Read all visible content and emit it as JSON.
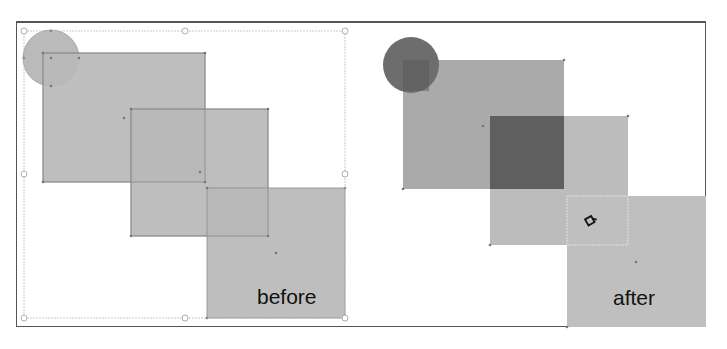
{
  "figure": {
    "panels": [
      {
        "id": "before",
        "label": "before",
        "shapes": [
          {
            "type": "circle",
            "cx": 51,
            "cy": 58,
            "r": 28,
            "fill": "#b9b9b9"
          },
          {
            "type": "rect",
            "x": 43,
            "y": 53,
            "w": 162,
            "h": 129,
            "fill": "#b9b9b9"
          },
          {
            "type": "rect",
            "x": 131,
            "y": 109,
            "w": 137,
            "h": 127,
            "fill": "#b9b9b9"
          },
          {
            "type": "rect",
            "x": 207,
            "y": 188,
            "w": 138,
            "h": 130,
            "fill": "#b9b9b9"
          }
        ],
        "selection_box": {
          "x": 24,
          "y": 31,
          "w": 321,
          "h": 287
        }
      },
      {
        "id": "after",
        "label": "after",
        "shapes": [
          {
            "type": "circle",
            "cx": 411,
            "cy": 65,
            "r": 28,
            "fill": "#6c6c6c"
          },
          {
            "type": "rect",
            "x": 403,
            "y": 60,
            "w": 161,
            "h": 129,
            "fill": "#a9a9a9"
          },
          {
            "type": "rect",
            "x": 490,
            "y": 116,
            "w": 138,
            "h": 129,
            "fill": "#bdbdbd"
          },
          {
            "type": "rect",
            "x": 490,
            "y": 116,
            "w": 74,
            "h": 73,
            "fill": "#5e5e5e"
          },
          {
            "type": "rect",
            "x": 567,
            "y": 196,
            "w": 139,
            "h": 131,
            "fill": "#bfbfbf"
          }
        ],
        "highlight_box": {
          "x": 567,
          "y": 196,
          "w": 61,
          "h": 49
        },
        "cursor": "paint-bucket-cursor"
      }
    ]
  }
}
